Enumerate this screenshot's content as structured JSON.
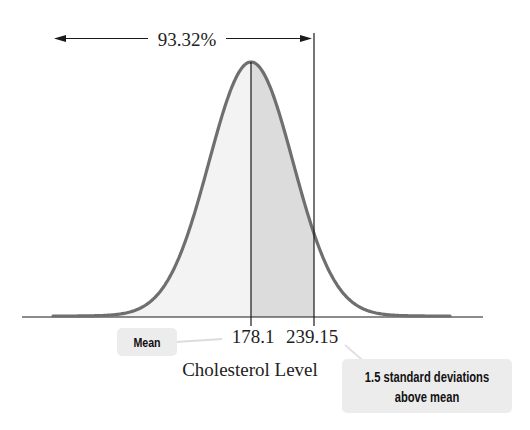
{
  "chart_data": {
    "type": "area",
    "title": "",
    "subtitle": "",
    "xlabel": "Cholesterol Level",
    "ylabel": "",
    "distribution": "normal",
    "mean": 178.1,
    "marked_value": 239.15,
    "z_score": 1.5,
    "std_dev": 40.7,
    "tick_labels": [
      "178.1",
      "239.15"
    ],
    "shaded_regions": [
      {
        "from": "-inf",
        "to": 178.1,
        "shade": "light"
      },
      {
        "from": 178.1,
        "to": 239.15,
        "shade": "medium"
      }
    ],
    "cumulative_percent_below_marked": 93.32,
    "annotations": [
      {
        "text": "93.32%",
        "type": "double-arrow",
        "span": "left tail to 239.15"
      },
      {
        "text": "Mean",
        "points_to": 178.1
      },
      {
        "text": "1.5 standard deviations above mean",
        "points_to": 239.15
      }
    ],
    "grid": false,
    "legend": "none"
  },
  "labels": {
    "percent": "93.32%",
    "mean_tick": "178.1",
    "marked_tick": "239.15",
    "x_axis": "Cholesterol Level",
    "mean_callout": "Mean",
    "sd_callout_line1": "1.5 standard deviations",
    "sd_callout_line2": "above mean"
  },
  "colors": {
    "curve": "#6f6f6f",
    "light_fill": "#f3f3f3",
    "medium_fill": "#dcdcdc",
    "callout_bg": "#ececec",
    "line": "#1a1a1a"
  }
}
